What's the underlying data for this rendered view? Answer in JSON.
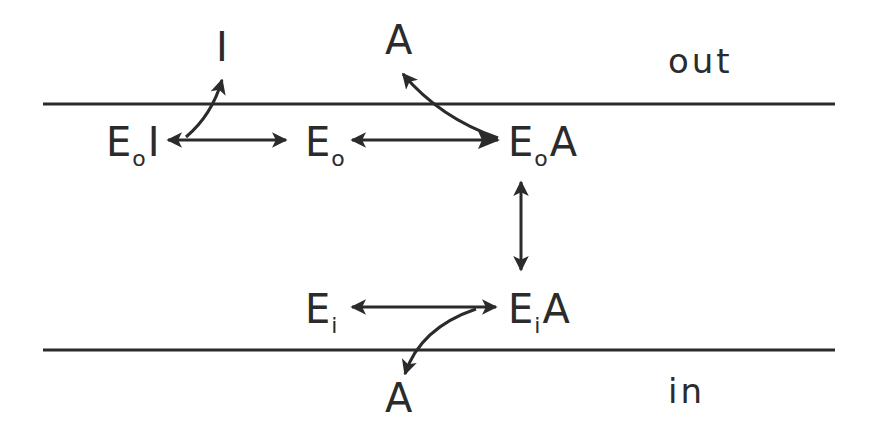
{
  "diagram": {
    "type": "membrane transport kinetic scheme",
    "colors": {
      "ink": "#2b2b2b",
      "background": "#ffffff"
    },
    "regions": {
      "outside_label": "out",
      "inside_label": "in"
    },
    "membrane": {
      "top_line": {
        "x1": 43,
        "x2": 835,
        "y": 104
      },
      "bottom_line": {
        "x1": 43,
        "x2": 835,
        "y": 350
      }
    },
    "free_species": {
      "inhibitor_out": "I",
      "substrate_out": "A",
      "substrate_in": "A"
    },
    "nodes": [
      {
        "id": "EoI",
        "base": "E",
        "subscript": "o",
        "ligand": "I"
      },
      {
        "id": "Eo",
        "base": "E",
        "subscript": "o",
        "ligand": ""
      },
      {
        "id": "EoA",
        "base": "E",
        "subscript": "o",
        "ligand": "A"
      },
      {
        "id": "Ei",
        "base": "E",
        "subscript": "i",
        "ligand": ""
      },
      {
        "id": "EiA",
        "base": "E",
        "subscript": "i",
        "ligand": "A"
      }
    ],
    "edges": [
      {
        "from": "EoI",
        "to": "Eo",
        "type": "bidirectional",
        "orientation": "horizontal"
      },
      {
        "from": "Eo",
        "to": "EoA",
        "type": "bidirectional",
        "orientation": "horizontal",
        "note": "arrowhead at Eo side; EoA end merges with A-release curve"
      },
      {
        "from": "EoI",
        "to": "I",
        "type": "curved",
        "note": "inhibitor released outward, crosses top membrane line"
      },
      {
        "from": "EoA",
        "to": "A (out)",
        "type": "curved",
        "note": "substrate released outward, crosses top membrane line"
      },
      {
        "from": "EoA",
        "to": "EiA",
        "type": "bidirectional",
        "orientation": "vertical"
      },
      {
        "from": "Ei",
        "to": "EiA",
        "type": "bidirectional",
        "orientation": "horizontal"
      },
      {
        "from": "EiA",
        "to": "A (in)",
        "type": "curved",
        "note": "substrate released inward, crosses bottom membrane line"
      }
    ]
  }
}
